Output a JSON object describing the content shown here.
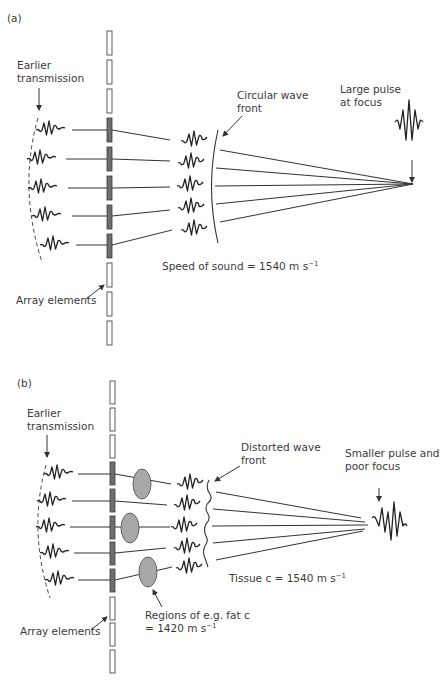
{
  "panel_a": {
    "label": "(a)",
    "earlier_transmission": [
      "Earlier",
      "transmission"
    ],
    "circular_wave_front": [
      "Circular wave",
      "front"
    ],
    "large_pulse": [
      "Large pulse",
      "at focus"
    ],
    "speed_of_sound": "Speed of sound = 1540 m s",
    "speed_sup": "−1",
    "array_elements": "Array elements",
    "element_count": 11,
    "active_elements": 5
  },
  "panel_b": {
    "label": "(b)",
    "earlier_transmission": [
      "Earlier",
      "transmission"
    ],
    "distorted_wave_front": [
      "Distorted wave",
      "front"
    ],
    "smaller_pulse": [
      "Smaller pulse and",
      "poor focus"
    ],
    "tissue_c": "Tissue c = 1540 m s",
    "tissue_sup": "−1",
    "regions": [
      "Regions of e.g. fat c",
      "= 1420 m s"
    ],
    "regions_sup": "−1",
    "array_elements": "Array elements",
    "element_count": 11,
    "active_elements": 5,
    "fat_regions": 3
  },
  "colors": {
    "active_element": "#6e6e6e",
    "fat_region": "#a8a8a8",
    "line": "#333333"
  }
}
